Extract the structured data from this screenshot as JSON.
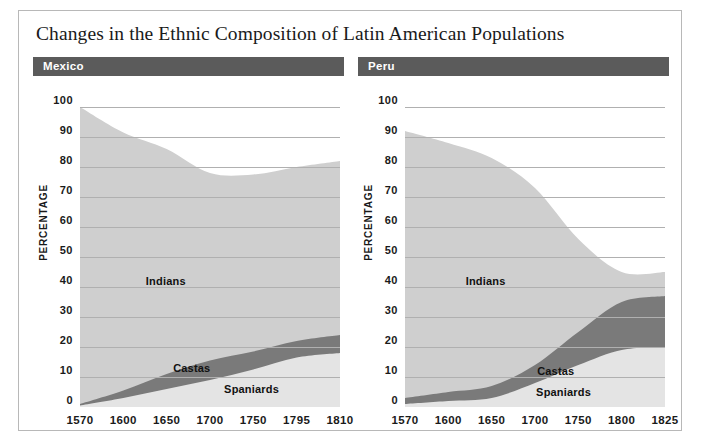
{
  "figure": {
    "title": "Changes in the Ethnic Composition of Latin American Populations",
    "frame_color": "#b8b8b8",
    "header_color": "#5b5b5b",
    "gridline_color": "#b0b0b0"
  },
  "panels": [
    {
      "name": "Mexico",
      "axis_title": "PERCENTAGE",
      "yticks": [
        "100",
        "90",
        "80",
        "70",
        "60",
        "50",
        "40",
        "30",
        "20",
        "10",
        "0"
      ],
      "xticks": [
        "1570",
        "1600",
        "1650",
        "1700",
        "1750",
        "1795",
        "1810"
      ],
      "series_labels": [
        "Indians",
        "Castas",
        "Spaniards"
      ]
    },
    {
      "name": "Peru",
      "axis_title": "PERCENTAGE",
      "yticks": [
        "100",
        "90",
        "80",
        "70",
        "60",
        "50",
        "40",
        "30",
        "20",
        "10",
        "0"
      ],
      "xticks": [
        "1570",
        "1600",
        "1650",
        "1700",
        "1750",
        "1800",
        "1825"
      ],
      "series_labels": [
        "Indians",
        "Castas",
        "Spaniards"
      ]
    }
  ],
  "chart_data": [
    {
      "type": "area",
      "title": "Mexico",
      "subtitle": "",
      "xlabel": "",
      "ylabel": "PERCENTAGE",
      "ylim": [
        0,
        100
      ],
      "yticks": [
        0,
        10,
        20,
        30,
        40,
        50,
        60,
        70,
        80,
        90,
        100
      ],
      "grid": true,
      "legend_position": "in-plot-labels",
      "stacked": true,
      "x": [
        1570,
        1600,
        1650,
        1700,
        1750,
        1795,
        1810
      ],
      "x_tick_labels": [
        "1570",
        "1600",
        "1650",
        "1700",
        "1750",
        "1795",
        "1810"
      ],
      "series": [
        {
          "name": "Spaniards",
          "color": "#e4e4e4",
          "values": [
            0.5,
            3,
            6,
            9,
            12.5,
            16.5,
            18
          ]
        },
        {
          "name": "Castas",
          "color": "#7a7a7a",
          "values": [
            0.5,
            2.5,
            5,
            6.5,
            6,
            5.5,
            6
          ]
        },
        {
          "name": "Indians",
          "color": "#cfcfcf",
          "values": [
            99,
            86,
            75,
            62.5,
            59,
            58,
            58
          ]
        }
      ],
      "cumulative_tops": {
        "Spaniards": [
          0.5,
          3,
          6,
          9,
          12.5,
          16.5,
          18
        ],
        "Castas": [
          1,
          5.5,
          11,
          15.5,
          18.5,
          22,
          24
        ],
        "Indians": [
          100,
          91.5,
          86,
          78,
          77.5,
          80,
          82
        ]
      },
      "indians_upper_boundary": [
        100,
        91,
        83,
        73,
        65,
        60,
        58
      ],
      "annotations": [
        {
          "text": "Indians",
          "x_frac": 0.33,
          "y_pct": 42
        },
        {
          "text": "Castas",
          "x_frac": 0.43,
          "y_pct": 13
        },
        {
          "text": "Spaniards",
          "x_frac": 0.66,
          "y_pct": 6
        }
      ]
    },
    {
      "type": "area",
      "title": "Peru",
      "subtitle": "",
      "xlabel": "",
      "ylabel": "PERCENTAGE",
      "ylim": [
        0,
        100
      ],
      "yticks": [
        0,
        10,
        20,
        30,
        40,
        50,
        60,
        70,
        80,
        90,
        100
      ],
      "grid": true,
      "legend_position": "in-plot-labels",
      "stacked": true,
      "x": [
        1570,
        1600,
        1650,
        1700,
        1750,
        1800,
        1825
      ],
      "x_tick_labels": [
        "1570",
        "1600",
        "1650",
        "1700",
        "1750",
        "1800",
        "1825"
      ],
      "series": [
        {
          "name": "Spaniards",
          "color": "#e4e4e4",
          "values": [
            1,
            2,
            3,
            8,
            14,
            19,
            20
          ]
        },
        {
          "name": "Castas",
          "color": "#7a7a7a",
          "values": [
            2,
            3,
            4,
            6,
            11,
            16,
            17
          ]
        },
        {
          "name": "Indians",
          "color": "#cfcfcf",
          "values": [
            89,
            83,
            76,
            59,
            31,
            10,
            8
          ]
        }
      ],
      "cumulative_tops": {
        "Spaniards": [
          1,
          2,
          3,
          8,
          14,
          19,
          20
        ],
        "Castas": [
          3,
          5,
          7,
          14,
          25,
          35,
          37
        ],
        "Indians": [
          92,
          88,
          83,
          73,
          56,
          45,
          45
        ]
      },
      "indians_upper_boundary": [
        92,
        88,
        83,
        73,
        56,
        45,
        45
      ],
      "annotations": [
        {
          "text": "Indians",
          "x_frac": 0.31,
          "y_pct": 42
        },
        {
          "text": "Castas",
          "x_frac": 0.58,
          "y_pct": 12
        },
        {
          "text": "Spaniards",
          "x_frac": 0.61,
          "y_pct": 5
        }
      ]
    }
  ]
}
